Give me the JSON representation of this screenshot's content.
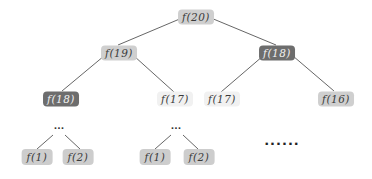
{
  "diagram": {
    "type": "recursion-tree",
    "colors": {
      "highlight_dark": "#6d6d6d",
      "normal": "#cfcfcf",
      "pale": "#f1f1f1",
      "edge": "#555555"
    },
    "nodes": [
      {
        "id": "n20",
        "label": "f(20)",
        "style": "mid"
      },
      {
        "id": "n19",
        "label": "f(19)",
        "style": "mid"
      },
      {
        "id": "n18a",
        "label": "f(18)",
        "style": "dark"
      },
      {
        "id": "n18b",
        "label": "f(18)",
        "style": "dark"
      },
      {
        "id": "n17a",
        "label": "f(17)",
        "style": "light"
      },
      {
        "id": "n17b",
        "label": "f(17)",
        "style": "light"
      },
      {
        "id": "n16",
        "label": "f(16)",
        "style": "mid"
      },
      {
        "id": "n1a",
        "label": "f(1)",
        "style": "leaf"
      },
      {
        "id": "n2a",
        "label": "f(2)",
        "style": "leaf"
      },
      {
        "id": "n1b",
        "label": "f(1)",
        "style": "leaf"
      },
      {
        "id": "n2b",
        "label": "f(2)",
        "style": "leaf"
      }
    ],
    "edges": [
      [
        "n20",
        "n19"
      ],
      [
        "n20",
        "n18a"
      ],
      [
        "n19",
        "n18b"
      ],
      [
        "n19",
        "n17a"
      ],
      [
        "n18a",
        "n17b"
      ],
      [
        "n18a",
        "n16"
      ],
      [
        "dotsA",
        "n1a"
      ],
      [
        "dotsA",
        "n2a"
      ],
      [
        "dotsB",
        "n1b"
      ],
      [
        "dotsB",
        "n2b"
      ]
    ],
    "ellipses": {
      "small_left": "...",
      "small_mid": "...",
      "large_right": "......"
    }
  }
}
